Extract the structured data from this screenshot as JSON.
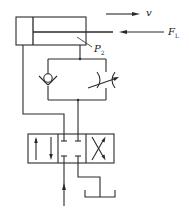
{
  "diagram": {
    "type": "hydraulic-circuit",
    "components": [
      {
        "id": "cylinder",
        "kind": "double-acting hydraulic cylinder"
      },
      {
        "id": "check-valve",
        "kind": "one-way (check) valve"
      },
      {
        "id": "throttle-valve",
        "kind": "adjustable throttle valve"
      },
      {
        "id": "directional-valve",
        "kind": "3-position 4-way directional control valve (O-center)"
      },
      {
        "id": "tank",
        "kind": "oil tank"
      }
    ],
    "labels": {
      "velocity": "v",
      "load_force": "F",
      "load_force_sub": "L",
      "pressure": "P",
      "pressure_sub": "2"
    },
    "colors": {
      "line": "#2a2a2a",
      "background": "#ffffff"
    }
  }
}
